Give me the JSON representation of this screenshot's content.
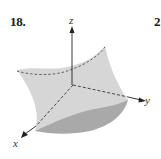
{
  "exercise": {
    "number": "18.",
    "next_number_partial": "2"
  },
  "axes": {
    "x_label": "x",
    "y_label": "y",
    "z_label": "z"
  },
  "colors": {
    "surface_light": "#d4d4d4",
    "surface_dark": "#a8a8a8",
    "axis": "#222222",
    "dashed_curve": "#555555",
    "background": "#ffffff"
  }
}
